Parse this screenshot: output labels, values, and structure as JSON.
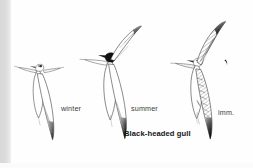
{
  "plate": {
    "kind": "field-guide-illustration",
    "subject": "Black-headed gull",
    "background_color": "#fefefe",
    "edge_strip_color": "#d8d8d8",
    "ink_color": "#111111",
    "caption": "Black-headed gull",
    "figures": [
      {
        "id": "winter",
        "label": "winter",
        "description": "Black-headed gull in winter plumage, in flight, seen from below; pale body, dark ear-spot, black wing-tip",
        "head_fill": "white",
        "wingtip": "black"
      },
      {
        "id": "summer",
        "label": "summer",
        "description": "Black-headed gull in summer plumage, in flight, seen from below; solid dark chocolate hood, black wing-tip",
        "head_fill": "black",
        "wingtip": "black"
      },
      {
        "id": "imm",
        "label": "imm.",
        "description": "Immature Black-headed gull in flight, seen from above; heavily barred brown upperwing coverts, dark trailing edge and wing-tip",
        "head_fill": "white",
        "wingtip": "black"
      }
    ]
  }
}
